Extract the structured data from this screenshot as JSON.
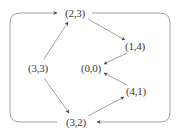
{
  "figure": {
    "kind": "directed-graph",
    "title": "",
    "background_color": "#ffffff",
    "line_color": "#8a8a8a",
    "arrow_color": "#4a4a4a",
    "text_color": "#3a3a3a"
  },
  "nodes": [
    {
      "id": "n23",
      "label": "(2,3)",
      "x": 75,
      "y": 13
    },
    {
      "id": "n14",
      "label": "(1,4)",
      "x": 135,
      "y": 46
    },
    {
      "id": "n00",
      "label": "(0,0)",
      "x": 91,
      "y": 68
    },
    {
      "id": "n41",
      "label": "(4,1)",
      "x": 136,
      "y": 91
    },
    {
      "id": "n32",
      "label": "(3,2)",
      "x": 76,
      "y": 122
    },
    {
      "id": "n33",
      "label": "(3,3)",
      "x": 38,
      "y": 68
    }
  ],
  "edges": [
    {
      "from": "(3,3)",
      "to": "(2,3)",
      "kind": "straight"
    },
    {
      "from": "(2,3)",
      "to": "(1,4)",
      "kind": "straight"
    },
    {
      "from": "(1,4)",
      "to": "(0,0)",
      "kind": "straight"
    },
    {
      "from": "(3,3)",
      "to": "(3,2)",
      "kind": "straight"
    },
    {
      "from": "(3,2)",
      "to": "(4,1)",
      "kind": "straight"
    },
    {
      "from": "(4,1)",
      "to": "(0,0)",
      "kind": "straight"
    },
    {
      "from": "(2,3)",
      "to": "(3,2)",
      "kind": "outer-loop-right"
    },
    {
      "from": "(3,2)",
      "to": "(2,3)",
      "kind": "outer-loop-left"
    }
  ]
}
